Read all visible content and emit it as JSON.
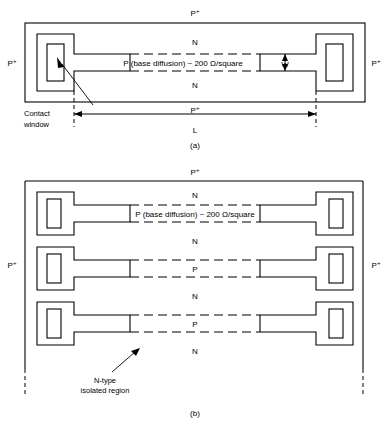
{
  "figure": {
    "stroke_color": "#000000",
    "background_color": "#ffffff"
  },
  "panel_a": {
    "caption": "(a)",
    "labels": {
      "top_pplus": "P",
      "top_pplus_sup": "+",
      "bottom_pplus": "P",
      "bottom_pplus_sup": "+",
      "left_pplus": "P",
      "left_pplus_sup": "+",
      "right_pplus": "P",
      "right_pplus_sup": "+",
      "n_upper": "N",
      "n_lower": "N",
      "strip_text": "P (base diffusion) ~ 200 Ω/square",
      "width_dim": "W",
      "length_dim": "L",
      "contact_window_line1": "Contact",
      "contact_window_line2": "window"
    }
  },
  "panel_b": {
    "caption": "(b)",
    "labels": {
      "top_pplus": "P",
      "top_pplus_sup": "+",
      "left_pplus": "P",
      "left_pplus_sup": "+",
      "right_pplus": "P",
      "right_pplus_sup": "+",
      "strip_text": "P (base diffusion) ~ 200 Ω/square",
      "region_1": "N",
      "region_2": "N",
      "region_3": "P",
      "region_4": "N",
      "region_5": "P",
      "region_6": "N",
      "isolated_line1": "N-type",
      "isolated_line2": "isolated region"
    }
  }
}
